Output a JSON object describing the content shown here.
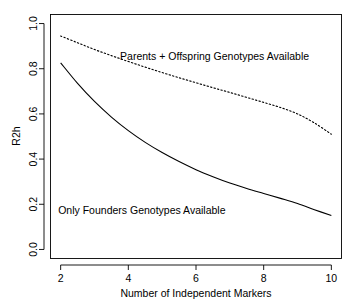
{
  "chart_data": {
    "type": "line",
    "title": "",
    "xlabel": "Number of Independent Markers",
    "ylabel": "R2h",
    "xlim": [
      1.7,
      10.3
    ],
    "ylim": [
      -0.04,
      1.04
    ],
    "xticks": [
      2,
      4,
      6,
      8,
      10
    ],
    "xtick_labels": [
      "2",
      "4",
      "6",
      "8",
      "10"
    ],
    "yticks": [
      0.0,
      0.2,
      0.4,
      0.6,
      0.8,
      1.0
    ],
    "ytick_labels": [
      "0.0",
      "0.2",
      "0.4",
      "0.6",
      "0.8",
      "1.0"
    ],
    "grid": false,
    "legend": "inline-annotations",
    "x": [
      2,
      2.5,
      3,
      3.5,
      4,
      4.5,
      5,
      5.5,
      6,
      6.5,
      7,
      7.5,
      8,
      8.5,
      9,
      9.5,
      10
    ],
    "series": [
      {
        "name": "Parents + Offspring Genotypes Available",
        "style": "dotted",
        "color": "#000000",
        "values": [
          0.945,
          0.915,
          0.885,
          0.858,
          0.832,
          0.807,
          0.783,
          0.76,
          0.738,
          0.716,
          0.695,
          0.673,
          0.651,
          0.628,
          0.6,
          0.56,
          0.51
        ]
      },
      {
        "name": "Only Founders Genotypes Available",
        "style": "solid",
        "color": "#000000",
        "values": [
          0.826,
          0.735,
          0.655,
          0.586,
          0.526,
          0.474,
          0.429,
          0.389,
          0.353,
          0.322,
          0.294,
          0.27,
          0.248,
          0.226,
          0.203,
          0.176,
          0.15
        ]
      }
    ],
    "annotations": [
      {
        "text": "Parents + Offspring Genotypes Available",
        "x": 6.55,
        "y": 0.855,
        "anchor": "middle"
      },
      {
        "text": "Only Founders Genotypes Available",
        "x": 4.4,
        "y": 0.175,
        "anchor": "middle"
      }
    ]
  }
}
